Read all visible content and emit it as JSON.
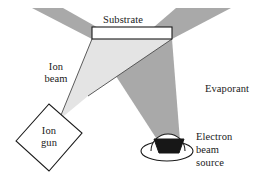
{
  "figure": {
    "kind": "schematic-diagram",
    "background_color": "#ffffff"
  },
  "colors": {
    "evaporant_gray": "#a9a9a9",
    "ion_beam_gray": "#e4e4e4",
    "outline_black": "#1a1a1a",
    "crucible_black": "#171717",
    "substrate_fill": "#ffffff",
    "ion_gun_fill": "#ffffff",
    "text": "#1a1a1a"
  },
  "labels": {
    "substrate": "Substrate",
    "ion_beam_line1": "Ion",
    "ion_beam_line2": "beam",
    "ion_gun_line1": "Ion",
    "ion_gun_line2": "gun",
    "evaporant": "Evaporant",
    "ebeam_line1": "Electron",
    "ebeam_line2": "beam",
    "ebeam_line3": "source"
  },
  "shapes": {
    "substrate_rect": {
      "name": "substrate",
      "x": 92,
      "y": 27,
      "width": 80,
      "height": 12,
      "fill": "#ffffff",
      "stroke": "#1a1a1a"
    },
    "ion_gun": {
      "name": "ion-gun",
      "points": "16,141 49,104 82,133 49,171",
      "fill": "#ffffff",
      "stroke": "#1a1a1a"
    },
    "evaporant_cone": {
      "name": "evaporant-cone",
      "points": "32,8 63,8 172,39 92,39",
      "points_right": "178,8 230,8 172,39 92,39",
      "fill": "#a9a9a9"
    },
    "ion_beam_cone": {
      "name": "ion-beam-cone",
      "points": "64,120 92,96 172,39 92,39",
      "fill": "#e4e4e4"
    },
    "crucible": {
      "name": "crucible",
      "points": "155,139 183,139 179,152 159,152",
      "fill": "#171717",
      "stroke": "#1a1a1a"
    },
    "source_body": {
      "name": "electron-beam-source-body",
      "cx": 167,
      "cy": 151,
      "rx": 26,
      "ry": 10,
      "fill": "#ffffff",
      "stroke": "#1a1a1a"
    },
    "source_arc": {
      "name": "electron-beam-source-arc",
      "cx": 169,
      "cy": 149,
      "r": 16,
      "fill": "none",
      "stroke": "#1a1a1a"
    }
  }
}
